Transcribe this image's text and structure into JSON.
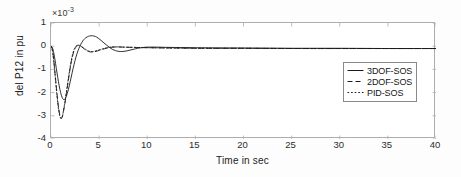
{
  "chart_data": {
    "type": "line",
    "title": "",
    "xlabel": "Time in sec",
    "ylabel": "del P12 in pu",
    "y_exponent_label": "10",
    "y_exponent_power": "-3",
    "y_multiplier": 0.001,
    "xlim": [
      0,
      40
    ],
    "ylim": [
      -4,
      1
    ],
    "xticks": [
      0,
      5,
      10,
      15,
      20,
      25,
      30,
      35,
      40
    ],
    "yticks": [
      1,
      0,
      -1,
      -2,
      -3,
      -4
    ],
    "grid": false,
    "legend_position": "upper-right-inside",
    "line_color": "#1a1a1a",
    "axis_color": "#aeaeae",
    "series": [
      {
        "name": "3DOF-SOS",
        "style": "solid",
        "points": [
          [
            0.0,
            0.0
          ],
          [
            0.12,
            -0.05
          ],
          [
            0.25,
            -0.22
          ],
          [
            0.4,
            -0.55
          ],
          [
            0.55,
            -0.95
          ],
          [
            0.7,
            -1.35
          ],
          [
            0.85,
            -1.7
          ],
          [
            1.0,
            -2.0
          ],
          [
            1.15,
            -2.2
          ],
          [
            1.3,
            -2.3
          ],
          [
            1.45,
            -2.28
          ],
          [
            1.6,
            -2.15
          ],
          [
            1.8,
            -1.88
          ],
          [
            2.0,
            -1.52
          ],
          [
            2.2,
            -1.14
          ],
          [
            2.4,
            -0.78
          ],
          [
            2.6,
            -0.46
          ],
          [
            2.8,
            -0.2
          ],
          [
            3.0,
            0.0
          ],
          [
            3.2,
            0.16
          ],
          [
            3.4,
            0.28
          ],
          [
            3.6,
            0.36
          ],
          [
            3.8,
            0.41
          ],
          [
            4.0,
            0.44
          ],
          [
            4.3,
            0.45
          ],
          [
            4.6,
            0.42
          ],
          [
            4.9,
            0.35
          ],
          [
            5.2,
            0.25
          ],
          [
            5.5,
            0.14
          ],
          [
            5.8,
            0.04
          ],
          [
            6.1,
            -0.06
          ],
          [
            6.4,
            -0.14
          ],
          [
            6.7,
            -0.19
          ],
          [
            7.0,
            -0.22
          ],
          [
            7.4,
            -0.23
          ],
          [
            7.8,
            -0.21
          ],
          [
            8.2,
            -0.17
          ],
          [
            8.6,
            -0.13
          ],
          [
            9.0,
            -0.09
          ],
          [
            9.5,
            -0.06
          ],
          [
            10.0,
            -0.04
          ],
          [
            11.0,
            -0.04
          ],
          [
            12.0,
            -0.05
          ],
          [
            14.0,
            -0.06
          ],
          [
            16.0,
            -0.07
          ],
          [
            20.0,
            -0.08
          ],
          [
            25.0,
            -0.09
          ],
          [
            30.0,
            -0.09
          ],
          [
            35.0,
            -0.1
          ],
          [
            40.0,
            -0.1
          ]
        ]
      },
      {
        "name": "2DOF-SOS",
        "style": "dashed",
        "points": [
          [
            0.0,
            0.0
          ],
          [
            0.1,
            -0.08
          ],
          [
            0.2,
            -0.3
          ],
          [
            0.3,
            -0.65
          ],
          [
            0.4,
            -1.08
          ],
          [
            0.5,
            -1.52
          ],
          [
            0.6,
            -1.95
          ],
          [
            0.7,
            -2.35
          ],
          [
            0.8,
            -2.68
          ],
          [
            0.9,
            -2.93
          ],
          [
            1.0,
            -3.08
          ],
          [
            1.1,
            -3.1
          ],
          [
            1.2,
            -3.0
          ],
          [
            1.3,
            -2.8
          ],
          [
            1.45,
            -2.45
          ],
          [
            1.6,
            -2.05
          ],
          [
            1.75,
            -1.62
          ],
          [
            1.9,
            -1.2
          ],
          [
            2.05,
            -0.82
          ],
          [
            2.2,
            -0.5
          ],
          [
            2.35,
            -0.26
          ],
          [
            2.5,
            -0.1
          ],
          [
            2.65,
            -0.01
          ],
          [
            2.8,
            0.03
          ],
          [
            3.0,
            0.02
          ],
          [
            3.2,
            -0.03
          ],
          [
            3.4,
            -0.1
          ],
          [
            3.6,
            -0.16
          ],
          [
            3.8,
            -0.21
          ],
          [
            4.0,
            -0.24
          ],
          [
            4.3,
            -0.25
          ],
          [
            4.6,
            -0.23
          ],
          [
            5.0,
            -0.18
          ],
          [
            5.4,
            -0.13
          ],
          [
            5.8,
            -0.08
          ],
          [
            6.2,
            -0.05
          ],
          [
            6.8,
            -0.03
          ],
          [
            7.5,
            -0.04
          ],
          [
            8.5,
            -0.05
          ],
          [
            9.5,
            -0.06
          ],
          [
            11.0,
            -0.07
          ],
          [
            13.0,
            -0.08
          ],
          [
            16.0,
            -0.09
          ],
          [
            20.0,
            -0.09
          ],
          [
            26.0,
            -0.1
          ],
          [
            32.0,
            -0.1
          ],
          [
            40.0,
            -0.1
          ]
        ]
      },
      {
        "name": "PID-SOS",
        "style": "dotted",
        "points": [
          [
            0.0,
            0.0
          ],
          [
            0.1,
            -0.1
          ],
          [
            0.2,
            -0.34
          ],
          [
            0.3,
            -0.7
          ],
          [
            0.4,
            -1.14
          ],
          [
            0.5,
            -1.6
          ],
          [
            0.6,
            -2.04
          ],
          [
            0.7,
            -2.44
          ],
          [
            0.8,
            -2.76
          ],
          [
            0.9,
            -2.99
          ],
          [
            1.0,
            -3.11
          ],
          [
            1.1,
            -3.11
          ],
          [
            1.2,
            -2.99
          ],
          [
            1.3,
            -2.77
          ],
          [
            1.45,
            -2.4
          ],
          [
            1.6,
            -1.98
          ],
          [
            1.75,
            -1.54
          ],
          [
            1.9,
            -1.12
          ],
          [
            2.05,
            -0.74
          ],
          [
            2.2,
            -0.43
          ],
          [
            2.35,
            -0.2
          ],
          [
            2.5,
            -0.05
          ],
          [
            2.65,
            0.03
          ],
          [
            2.8,
            0.05
          ],
          [
            3.0,
            0.03
          ],
          [
            3.2,
            -0.02
          ],
          [
            3.4,
            -0.08
          ],
          [
            3.6,
            -0.14
          ],
          [
            3.8,
            -0.19
          ],
          [
            4.0,
            -0.22
          ],
          [
            4.3,
            -0.23
          ],
          [
            4.6,
            -0.21
          ],
          [
            5.0,
            -0.16
          ],
          [
            5.4,
            -0.11
          ],
          [
            5.8,
            -0.07
          ],
          [
            6.2,
            -0.04
          ],
          [
            6.8,
            -0.03
          ],
          [
            7.5,
            -0.04
          ],
          [
            8.5,
            -0.05
          ],
          [
            9.5,
            -0.06
          ],
          [
            11.0,
            -0.07
          ],
          [
            13.0,
            -0.08
          ],
          [
            16.0,
            -0.09
          ],
          [
            20.0,
            -0.09
          ],
          [
            26.0,
            -0.1
          ],
          [
            32.0,
            -0.1
          ],
          [
            40.0,
            -0.1
          ]
        ]
      }
    ],
    "legend": [
      {
        "label": "3DOF-SOS",
        "style": "solid"
      },
      {
        "label": "2DOF-SOS",
        "style": "dashed"
      },
      {
        "label": "PID-SOS",
        "style": "dotted"
      }
    ]
  }
}
